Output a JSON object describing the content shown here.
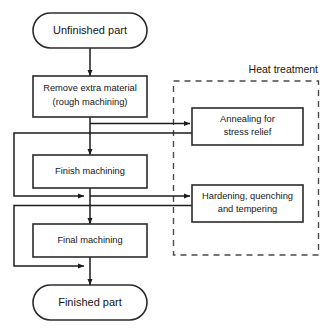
{
  "diagram": {
    "type": "process-flowchart",
    "title_visible": false,
    "colors": {
      "background": "#ffffff",
      "stroke": "#1c1c1c",
      "box_stroke": "#2b2b2b",
      "dashed_stroke": "#4a4a4a",
      "text": "#161616"
    },
    "terminals": [
      {
        "id": "start",
        "label": "Unfinished part"
      },
      {
        "id": "end",
        "label": "Finished part"
      }
    ],
    "process_steps": [
      {
        "id": "rough",
        "line1": "Remove extra material",
        "line2": "(rough machining)"
      },
      {
        "id": "finish",
        "line1": "Finish machining",
        "line2": ""
      },
      {
        "id": "final",
        "line1": "Final machining",
        "line2": ""
      }
    ],
    "group": {
      "id": "heat-treatment",
      "label": "Heat treatment",
      "members": [
        {
          "id": "annealing",
          "line1": "Annealing for",
          "line2": "stress relief"
        },
        {
          "id": "hardening",
          "line1": "Hardening, quenching",
          "line2": "and tempering"
        }
      ]
    },
    "connections": [
      {
        "from": "start",
        "to": "rough",
        "kind": "arrow"
      },
      {
        "from": "rough",
        "to": "finish",
        "kind": "arrow"
      },
      {
        "from": "rough",
        "to": "annealing",
        "kind": "branch-arrow"
      },
      {
        "from": "annealing",
        "to": "finish-input",
        "kind": "return-loop"
      },
      {
        "from": "finish",
        "to": "final",
        "kind": "arrow"
      },
      {
        "from": "finish",
        "to": "hardening",
        "kind": "branch-arrow"
      },
      {
        "from": "hardening",
        "to": "final-input",
        "kind": "return-loop"
      },
      {
        "from": "final",
        "to": "end",
        "kind": "arrow"
      }
    ]
  }
}
